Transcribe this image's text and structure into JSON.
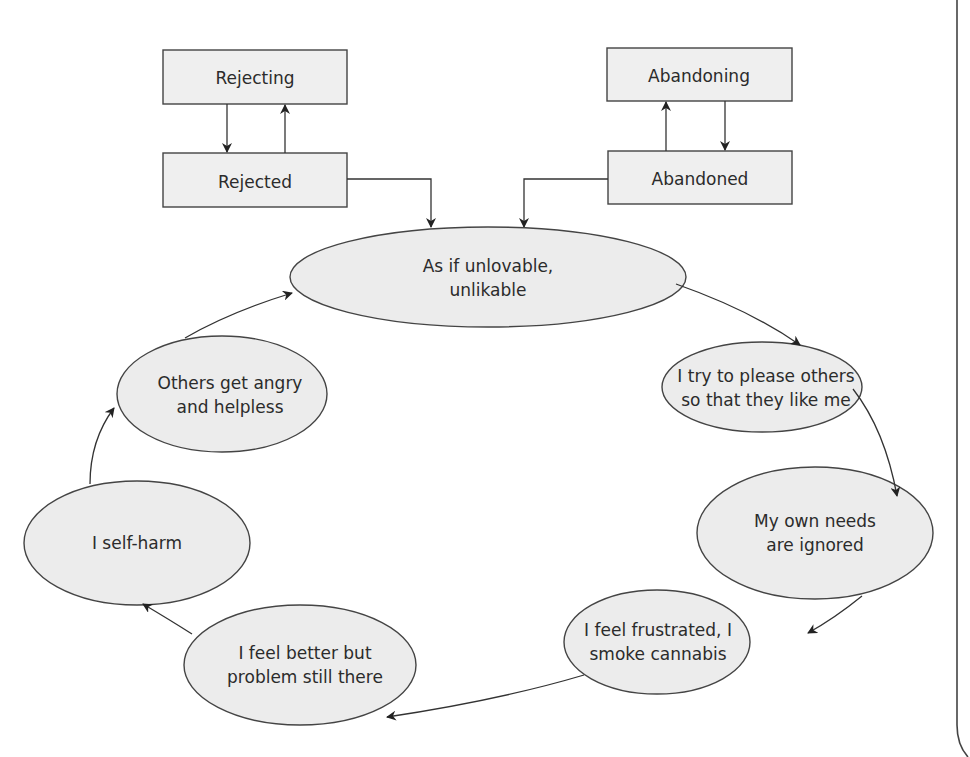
{
  "diagram": {
    "boxes": {
      "rejecting": "Rejecting",
      "rejected": "Rejected",
      "abandoning": "Abandoning",
      "abandoned": "Abandoned"
    },
    "cycle": [
      {
        "id": "unlovable",
        "lines": [
          "As if unlovable,",
          "unlikable"
        ]
      },
      {
        "id": "please",
        "lines": [
          "I try to please others",
          "so that they like me"
        ]
      },
      {
        "id": "needs",
        "lines": [
          "My own needs",
          "are ignored"
        ]
      },
      {
        "id": "frustrated",
        "lines": [
          "I feel frustrated, I",
          "smoke cannabis"
        ]
      },
      {
        "id": "better",
        "lines": [
          "I feel better but",
          "problem still there"
        ]
      },
      {
        "id": "selfharm",
        "lines": [
          "I self-harm"
        ]
      },
      {
        "id": "angry",
        "lines": [
          "Others get angry",
          "and helpless"
        ]
      }
    ],
    "colors": {
      "node_fill": "#ececec",
      "box_fill": "#efefef",
      "stroke": "#444444",
      "text": "#2b2b2b"
    }
  }
}
